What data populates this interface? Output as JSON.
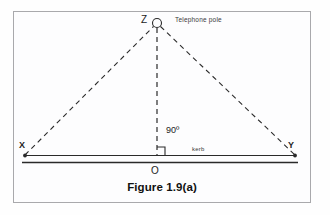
{
  "figure": {
    "caption": "Figure 1.9(a)",
    "type": "geometry-diagram",
    "frame": {
      "border_color": "#a9a9ac",
      "background": "#fdfdfe"
    },
    "labels": {
      "apex_point": "Z",
      "apex_annotation": "Telephone pole",
      "angle": "90º",
      "baseline": "kerb",
      "left_point": "X",
      "right_point": "Y",
      "foot_point": "O"
    },
    "colors": {
      "stroke": "#2a2a2a",
      "text": "#1c1c1c",
      "annotation_text": "#3a3a3a"
    },
    "geometry": {
      "apex": {
        "x": 157,
        "y": 23
      },
      "left_vertex": {
        "x": 25,
        "y": 155
      },
      "right_vertex": {
        "x": 295,
        "y": 155
      },
      "foot": {
        "x": 157,
        "y": 155
      },
      "apex_circle_radius": 4.5,
      "kerb_line_upper_y": 155,
      "kerb_line_lower_y": 162,
      "right_angle_marker_size": 8,
      "dash_pattern": "5,4"
    }
  }
}
